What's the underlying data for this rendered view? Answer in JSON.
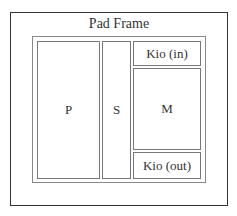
{
  "diagram": {
    "title": "Pad Frame",
    "blocks": {
      "p": "P",
      "s": "S",
      "kio_in": "Kio (in)",
      "m": "M",
      "kio_out": "Kio (out)"
    },
    "colors": {
      "outer_border": "#333333",
      "inner_border": "#888888",
      "block_border": "#777777"
    }
  }
}
